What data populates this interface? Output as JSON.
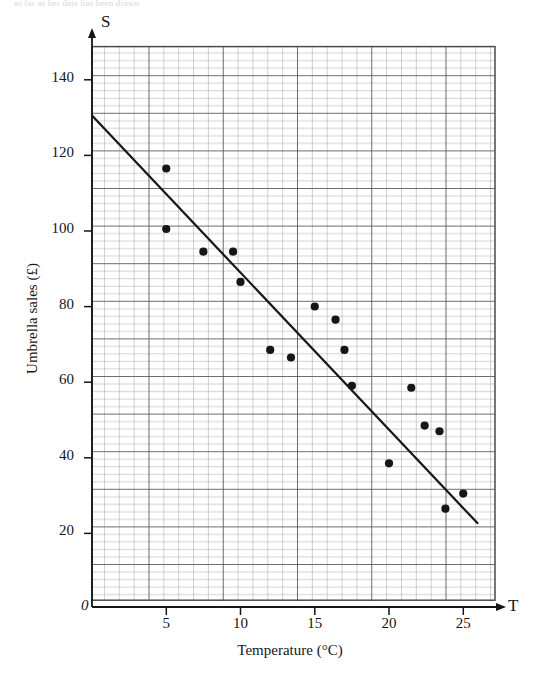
{
  "page": {
    "top_note": "as far as her data has been drawn"
  },
  "chart_data": {
    "type": "scatter",
    "title": "",
    "xlabel": "Temperature (°C)",
    "ylabel": "Umbrella sales (£)",
    "x_axis_letter": "T",
    "y_axis_letter": "S",
    "origin_label": "0",
    "xlim": [
      0,
      27.1
    ],
    "ylim": [
      0,
      150
    ],
    "xticks": [
      5,
      10,
      15,
      20,
      25
    ],
    "xtick_labels": [
      "5",
      "10",
      "15",
      "20",
      "25"
    ],
    "yticks": [
      20,
      40,
      60,
      80,
      100,
      120,
      140
    ],
    "ytick_labels": [
      "20",
      "40",
      "60",
      "80",
      "100",
      "120",
      "140"
    ],
    "grid": "minor and major graph paper, minor every 1 unit x / 2 units y, major every 5 units x / 10 units y",
    "grid_minor_color": "#9a9a9f",
    "grid_major_color": "#4a4a50",
    "marker_color": "#161616",
    "line_color": "#161616",
    "legend": "none",
    "points": [
      {
        "x": 5.0,
        "y": 116
      },
      {
        "x": 5.0,
        "y": 100
      },
      {
        "x": 7.5,
        "y": 94
      },
      {
        "x": 9.5,
        "y": 94
      },
      {
        "x": 10.0,
        "y": 86
      },
      {
        "x": 12.0,
        "y": 68
      },
      {
        "x": 13.4,
        "y": 66
      },
      {
        "x": 15.0,
        "y": 79.5
      },
      {
        "x": 16.4,
        "y": 76
      },
      {
        "x": 17.0,
        "y": 68
      },
      {
        "x": 17.5,
        "y": 58.5
      },
      {
        "x": 20.0,
        "y": 38
      },
      {
        "x": 21.5,
        "y": 58
      },
      {
        "x": 22.4,
        "y": 48
      },
      {
        "x": 23.4,
        "y": 46.5
      },
      {
        "x": 23.8,
        "y": 26
      },
      {
        "x": 25.0,
        "y": 30
      }
    ],
    "line_of_best_fit": {
      "label": "line of best fit",
      "start": {
        "x": 0.0,
        "y": 130
      },
      "end": {
        "x": 26.0,
        "y": 22
      }
    }
  }
}
